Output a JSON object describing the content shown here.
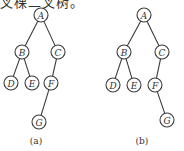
{
  "header": {
    "text": "叉棵二叉树。"
  },
  "colors": {
    "stroke": "#3a3a3a",
    "text": "#333333",
    "background": "#ffffff"
  },
  "trees": [
    {
      "label": "(a)",
      "nodes": [
        {
          "id": "A",
          "x": 41,
          "y": 15
        },
        {
          "id": "B",
          "x": 22,
          "y": 52
        },
        {
          "id": "C",
          "x": 58,
          "y": 52
        },
        {
          "id": "D",
          "x": 11,
          "y": 83
        },
        {
          "id": "E",
          "x": 32,
          "y": 83
        },
        {
          "id": "F",
          "x": 51,
          "y": 83
        },
        {
          "id": "G",
          "x": 39,
          "y": 122
        }
      ],
      "edges": [
        [
          "A",
          "B"
        ],
        [
          "A",
          "C"
        ],
        [
          "B",
          "D"
        ],
        [
          "B",
          "E"
        ],
        [
          "C",
          "F"
        ],
        [
          "F",
          "G"
        ]
      ],
      "label_pos": {
        "x": 36,
        "y": 144
      }
    },
    {
      "label": "(b)",
      "nodes": [
        {
          "id": "A",
          "x": 144,
          "y": 15
        },
        {
          "id": "B",
          "x": 124,
          "y": 52
        },
        {
          "id": "C",
          "x": 162,
          "y": 52
        },
        {
          "id": "D",
          "x": 113,
          "y": 85
        },
        {
          "id": "E",
          "x": 134,
          "y": 85
        },
        {
          "id": "F",
          "x": 155,
          "y": 85
        },
        {
          "id": "G",
          "x": 167,
          "y": 120
        }
      ],
      "edges": [
        [
          "A",
          "B"
        ],
        [
          "A",
          "C"
        ],
        [
          "B",
          "D"
        ],
        [
          "B",
          "E"
        ],
        [
          "C",
          "F"
        ],
        [
          "F",
          "G"
        ]
      ],
      "label_pos": {
        "x": 142,
        "y": 144
      }
    }
  ],
  "node_radius": 7
}
